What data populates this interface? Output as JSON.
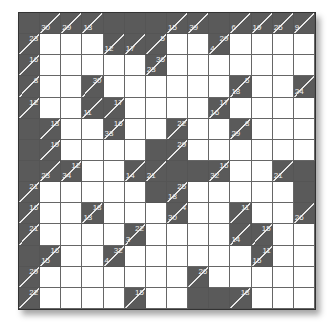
{
  "puzzle": {
    "type": "kakuro",
    "rows": 14,
    "cols": 14,
    "colors": {
      "block": "#5a5a5a",
      "blank": "#ffffff",
      "clue_text": "#f0f0f0"
    },
    "grid": [
      [
        {
          "t": "B"
        },
        {
          "t": "C",
          "d": "30"
        },
        {
          "t": "C",
          "d": "29"
        },
        {
          "t": "C",
          "d": "13"
        },
        {
          "t": "B"
        },
        {
          "t": "B"
        },
        {
          "t": "B"
        },
        {
          "t": "C",
          "d": "15"
        },
        {
          "t": "C",
          "d": "39"
        },
        {
          "t": "B"
        },
        {
          "t": "C",
          "d": "6"
        },
        {
          "t": "C",
          "d": "19"
        },
        {
          "t": "C",
          "d": "25"
        },
        {
          "t": "C",
          "d": "9"
        }
      ],
      [
        {
          "t": "C",
          "a": "23"
        },
        {
          "t": "W"
        },
        {
          "t": "W"
        },
        {
          "t": "W"
        },
        {
          "t": "C",
          "d": "12"
        },
        {
          "t": "C",
          "d": "17"
        },
        {
          "t": "C",
          "a": "5"
        },
        {
          "t": "W"
        },
        {
          "t": "W"
        },
        {
          "t": "C",
          "d": "4",
          "a": "29"
        },
        {
          "t": "W"
        },
        {
          "t": "W"
        },
        {
          "t": "W"
        },
        {
          "t": "W"
        }
      ],
      [
        {
          "t": "C",
          "a": "16"
        },
        {
          "t": "W"
        },
        {
          "t": "W"
        },
        {
          "t": "W"
        },
        {
          "t": "W"
        },
        {
          "t": "W"
        },
        {
          "t": "C",
          "d": "23",
          "a": "36"
        },
        {
          "t": "W"
        },
        {
          "t": "W"
        },
        {
          "t": "W"
        },
        {
          "t": "W"
        },
        {
          "t": "W"
        },
        {
          "t": "W"
        },
        {
          "t": "W"
        }
      ],
      [
        {
          "t": "C",
          "a": "8"
        },
        {
          "t": "W"
        },
        {
          "t": "W"
        },
        {
          "t": "C",
          "a": "30"
        },
        {
          "t": "W"
        },
        {
          "t": "W"
        },
        {
          "t": "W"
        },
        {
          "t": "W"
        },
        {
          "t": "W"
        },
        {
          "t": "W"
        },
        {
          "t": "C",
          "d": "18",
          "a": "5"
        },
        {
          "t": "W"
        },
        {
          "t": "W"
        },
        {
          "t": "C",
          "d": "24"
        }
      ],
      [
        {
          "t": "C",
          "a": "12"
        },
        {
          "t": "W"
        },
        {
          "t": "W"
        },
        {
          "t": "C",
          "d": "11"
        },
        {
          "t": "C",
          "a": "17"
        },
        {
          "t": "W"
        },
        {
          "t": "W"
        },
        {
          "t": "W"
        },
        {
          "t": "W"
        },
        {
          "t": "C",
          "d": "16",
          "a": "17"
        },
        {
          "t": "W"
        },
        {
          "t": "W"
        },
        {
          "t": "W"
        },
        {
          "t": "W"
        }
      ],
      [
        {
          "t": "B"
        },
        {
          "t": "C",
          "a": "13"
        },
        {
          "t": "W"
        },
        {
          "t": "W"
        },
        {
          "t": "C",
          "d": "33",
          "a": "16"
        },
        {
          "t": "W"
        },
        {
          "t": "W"
        },
        {
          "t": "C",
          "a": "22"
        },
        {
          "t": "W"
        },
        {
          "t": "W"
        },
        {
          "t": "C",
          "d": "29",
          "a": "8"
        },
        {
          "t": "W"
        },
        {
          "t": "W"
        },
        {
          "t": "W"
        }
      ],
      [
        {
          "t": "B"
        },
        {
          "t": "C",
          "a": "19"
        },
        {
          "t": "W"
        },
        {
          "t": "W"
        },
        {
          "t": "W"
        },
        {
          "t": "W"
        },
        {
          "t": "B"
        },
        {
          "t": "C",
          "a": "29"
        },
        {
          "t": "W"
        },
        {
          "t": "W"
        },
        {
          "t": "W"
        },
        {
          "t": "W"
        },
        {
          "t": "W"
        },
        {
          "t": "W"
        }
      ],
      [
        {
          "t": "B"
        },
        {
          "t": "C",
          "d": "23"
        },
        {
          "t": "C",
          "d": "34",
          "a": "12"
        },
        {
          "t": "W"
        },
        {
          "t": "W"
        },
        {
          "t": "C",
          "d": "14"
        },
        {
          "t": "C",
          "d": "21"
        },
        {
          "t": "B"
        },
        {
          "t": "B"
        },
        {
          "t": "C",
          "d": "32",
          "a": "16"
        },
        {
          "t": "W"
        },
        {
          "t": "W"
        },
        {
          "t": "C",
          "d": "21"
        },
        {
          "t": "B"
        }
      ],
      [
        {
          "t": "C",
          "a": "21"
        },
        {
          "t": "W"
        },
        {
          "t": "W"
        },
        {
          "t": "W"
        },
        {
          "t": "W"
        },
        {
          "t": "W"
        },
        {
          "t": "B"
        },
        {
          "t": "C",
          "d": "18",
          "a": "25"
        },
        {
          "t": "W"
        },
        {
          "t": "W"
        },
        {
          "t": "W"
        },
        {
          "t": "W"
        },
        {
          "t": "W"
        },
        {
          "t": "B"
        }
      ],
      [
        {
          "t": "C",
          "a": "16"
        },
        {
          "t": "W"
        },
        {
          "t": "W"
        },
        {
          "t": "C",
          "d": "13",
          "a": "18"
        },
        {
          "t": "W"
        },
        {
          "t": "W"
        },
        {
          "t": "W"
        },
        {
          "t": "C",
          "d": "30",
          "a": "4"
        },
        {
          "t": "W"
        },
        {
          "t": "W"
        },
        {
          "t": "C",
          "a": "11"
        },
        {
          "t": "W"
        },
        {
          "t": "W"
        },
        {
          "t": "C",
          "d": "26"
        }
      ],
      [
        {
          "t": "C",
          "a": "21"
        },
        {
          "t": "W"
        },
        {
          "t": "W"
        },
        {
          "t": "W"
        },
        {
          "t": "W"
        },
        {
          "t": "C",
          "d": "3",
          "a": "22"
        },
        {
          "t": "W"
        },
        {
          "t": "W"
        },
        {
          "t": "W"
        },
        {
          "t": "W"
        },
        {
          "t": "C",
          "d": "14"
        },
        {
          "t": "C",
          "a": "15"
        },
        {
          "t": "W"
        },
        {
          "t": "W"
        }
      ],
      [
        {
          "t": "B"
        },
        {
          "t": "C",
          "d": "15",
          "a": "16"
        },
        {
          "t": "W"
        },
        {
          "t": "W"
        },
        {
          "t": "C",
          "d": "4",
          "a": "32"
        },
        {
          "t": "W"
        },
        {
          "t": "W"
        },
        {
          "t": "W"
        },
        {
          "t": "W"
        },
        {
          "t": "W"
        },
        {
          "t": "W"
        },
        {
          "t": "C",
          "d": "15",
          "a": "11"
        },
        {
          "t": "W"
        },
        {
          "t": "W"
        }
      ],
      [
        {
          "t": "C",
          "a": "29"
        },
        {
          "t": "W"
        },
        {
          "t": "W"
        },
        {
          "t": "W"
        },
        {
          "t": "W"
        },
        {
          "t": "W"
        },
        {
          "t": "W"
        },
        {
          "t": "W"
        },
        {
          "t": "C",
          "a": "26"
        },
        {
          "t": "W"
        },
        {
          "t": "W"
        },
        {
          "t": "W"
        },
        {
          "t": "W"
        },
        {
          "t": "W"
        }
      ],
      [
        {
          "t": "C",
          "a": "22"
        },
        {
          "t": "W"
        },
        {
          "t": "W"
        },
        {
          "t": "W"
        },
        {
          "t": "W"
        },
        {
          "t": "C",
          "a": "15"
        },
        {
          "t": "W"
        },
        {
          "t": "W"
        },
        {
          "t": "B"
        },
        {
          "t": "B"
        },
        {
          "t": "C",
          "a": "18"
        },
        {
          "t": "W"
        },
        {
          "t": "W"
        },
        {
          "t": "W"
        }
      ]
    ]
  }
}
